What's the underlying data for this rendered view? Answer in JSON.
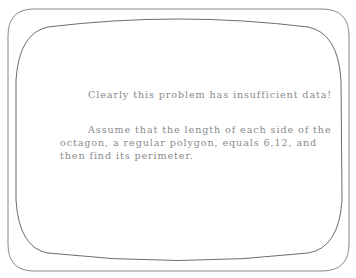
{
  "screen": {
    "heading": "Clearly this problem has insufficient data!",
    "paragraph_lines": [
      "Assume that the length of each side of the",
      "octagon, a regular polygon, equals 6,12, and",
      "then find its perimeter."
    ]
  },
  "colors": {
    "background": "#ffffff",
    "frame_line": "#7a7a7a",
    "text": "#8a8a8a"
  }
}
